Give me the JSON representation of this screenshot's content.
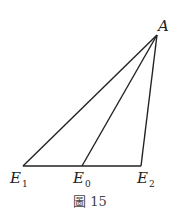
{
  "diagram": {
    "vertices": {
      "A": {
        "label": "A",
        "x": 157,
        "y": 35
      },
      "E1": {
        "label": "E",
        "sub": "1",
        "x": 23,
        "y": 166
      },
      "E0": {
        "label": "E",
        "sub": "0",
        "x": 82,
        "y": 166
      },
      "E2": {
        "label": "E",
        "sub": "2",
        "x": 141,
        "y": 166
      }
    },
    "segments": [
      [
        "E1",
        "E2"
      ],
      [
        "E1",
        "A"
      ],
      [
        "E0",
        "A"
      ],
      [
        "E2",
        "A"
      ]
    ],
    "line_color": "#222222"
  },
  "caption": "圖 15"
}
